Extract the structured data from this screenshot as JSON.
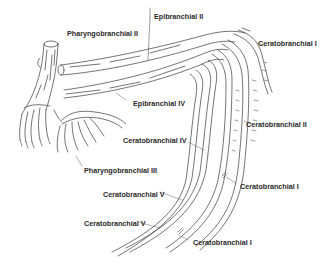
{
  "figure": {
    "labels": [
      {
        "id": "pharyngobranchial-ii",
        "text": "Pharyngobranchial II",
        "x": 67,
        "y": 30
      },
      {
        "id": "epibranchial-ii",
        "text": "Epibranchial II",
        "x": 154,
        "y": 13
      },
      {
        "id": "ceratobranchial-i-top",
        "text": "Ceratobranchial I",
        "x": 258,
        "y": 40
      },
      {
        "id": "epibranchial-iv",
        "text": "Epibranchial IV",
        "x": 133,
        "y": 100
      },
      {
        "id": "ceratobranchial-ii",
        "text": "Ceratobranchial II",
        "x": 246,
        "y": 121
      },
      {
        "id": "ceratobranchial-iv",
        "text": "Ceratobranchial IV",
        "x": 123,
        "y": 137
      },
      {
        "id": "pharyngobranchial-iii",
        "text": "Pharyngobranchial III",
        "x": 84,
        "y": 167
      },
      {
        "id": "ceratobranchial-i-mid",
        "text": "Ceratobranchial I",
        "x": 240,
        "y": 183
      },
      {
        "id": "ceratobranchial-v-upper",
        "text": "Ceratobranchial V",
        "x": 103,
        "y": 191
      },
      {
        "id": "ceratobranchial-v-lower",
        "text": "Ceratobranchial V",
        "x": 84,
        "y": 220
      },
      {
        "id": "ceratobranchial-i-bottom",
        "text": "Ceratobranchial I",
        "x": 193,
        "y": 239
      }
    ],
    "colors": {
      "line": "#3a3a3a",
      "text": "#2a2a2a",
      "background": "#ffffff"
    }
  }
}
